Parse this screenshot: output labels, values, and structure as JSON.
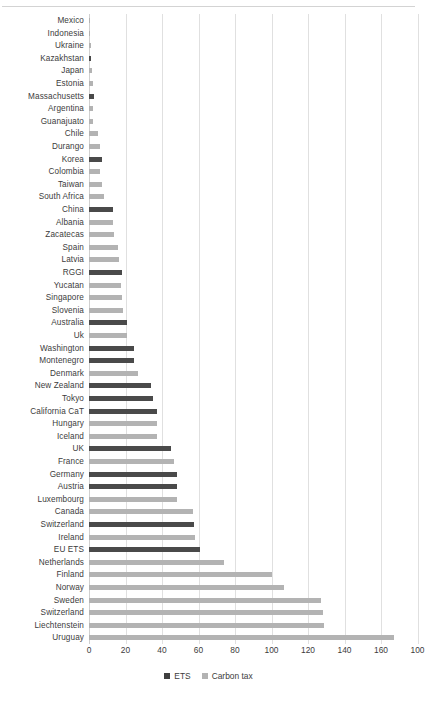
{
  "chart_data": {
    "type": "bar",
    "orientation": "horizontal",
    "title": "",
    "xlabel": "",
    "ylabel": "",
    "xlim": [
      0,
      180
    ],
    "grid": true,
    "xticks": [
      0,
      20,
      40,
      60,
      80,
      100,
      120,
      140,
      160,
      100
    ],
    "legend_position": "bottom",
    "legend": [
      {
        "name": "ETS",
        "color": "#4a4a4a"
      },
      {
        "name": "Carbon tax",
        "color": "#b3b3b3"
      }
    ],
    "categories": [
      "Mexico",
      "Indonesia",
      "Ukraine",
      "Kazakhstan",
      "Japan",
      "Estonia",
      "Massachusetts",
      "Argentina",
      "Guanajuato",
      "Chile",
      "Durango",
      "Korea",
      "Colombia",
      "Taiwan",
      "South Africa",
      "China",
      "Albania",
      "Zacatecas",
      "Spain",
      "Latvia",
      "RGGI",
      "Yucatan",
      "Singapore",
      "Slovenia",
      "Australia",
      "Uk",
      "Washington",
      "Montenegro",
      "Denmark",
      "New Zealand",
      "Tokyo",
      "California CaT",
      "Hungary",
      "Iceland",
      "UK",
      "France",
      "Germany",
      "Austria",
      "Luxembourg",
      "Canada",
      "Switzerland",
      "Ireland",
      "EU ETS",
      "Netherlands",
      "Finland",
      "Norway",
      "Sweden",
      "Switzerland",
      "Liechtenstein",
      "Uruguay"
    ],
    "bars": [
      {
        "category": "Mexico",
        "series": "Carbon tax",
        "value": 0.4
      },
      {
        "category": "Indonesia",
        "series": "Carbon tax",
        "value": 0.6
      },
      {
        "category": "Ukraine",
        "series": "Carbon tax",
        "value": 1.0
      },
      {
        "category": "Kazakhstan",
        "series": "ETS",
        "value": 1.2
      },
      {
        "category": "Japan",
        "series": "Carbon tax",
        "value": 1.6
      },
      {
        "category": "Estonia",
        "series": "Carbon tax",
        "value": 2.0
      },
      {
        "category": "Massachusetts",
        "series": "ETS",
        "value": 2.6
      },
      {
        "category": "Argentina",
        "series": "Carbon tax",
        "value": 2.0
      },
      {
        "category": "Guanajuato",
        "series": "Carbon tax",
        "value": 2.2
      },
      {
        "category": "Chile",
        "series": "Carbon tax",
        "value": 5.0
      },
      {
        "category": "Durango",
        "series": "Carbon tax",
        "value": 6.0
      },
      {
        "category": "Korea",
        "series": "ETS",
        "value": 7.0
      },
      {
        "category": "Colombia",
        "series": "Carbon tax",
        "value": 6.0
      },
      {
        "category": "Taiwan",
        "series": "Carbon tax",
        "value": 7.0
      },
      {
        "category": "South Africa",
        "series": "Carbon tax",
        "value": 8.0
      },
      {
        "category": "China",
        "series": "ETS",
        "value": 13.0
      },
      {
        "category": "Albania",
        "series": "Carbon tax",
        "value": 13.0
      },
      {
        "category": "Zacatecas",
        "series": "Carbon tax",
        "value": 13.5
      },
      {
        "category": "Spain",
        "series": "Carbon tax",
        "value": 16.0
      },
      {
        "category": "Latvia",
        "series": "Carbon tax",
        "value": 16.5
      },
      {
        "category": "RGGI",
        "series": "ETS",
        "value": 18.0
      },
      {
        "category": "Yucatan",
        "series": "Carbon tax",
        "value": 17.5
      },
      {
        "category": "Singapore",
        "series": "Carbon tax",
        "value": 18.0
      },
      {
        "category": "Slovenia",
        "series": "Carbon tax",
        "value": 18.5
      },
      {
        "category": "Australia",
        "series": "ETS",
        "value": 21.0
      },
      {
        "category": "Uk",
        "series": "Carbon tax",
        "value": 21.0
      },
      {
        "category": "Washington",
        "series": "ETS",
        "value": 24.5
      },
      {
        "category": "Montenegro",
        "series": "ETS",
        "value": 24.5
      },
      {
        "category": "Denmark",
        "series": "Carbon tax",
        "value": 27.0
      },
      {
        "category": "New Zealand",
        "series": "ETS",
        "value": 34.0
      },
      {
        "category": "Tokyo",
        "series": "ETS",
        "value": 35.0
      },
      {
        "category": "California CaT",
        "series": "ETS",
        "value": 37.0
      },
      {
        "category": "Hungary",
        "series": "Carbon tax",
        "value": 37.0
      },
      {
        "category": "Iceland",
        "series": "Carbon tax",
        "value": 37.5
      },
      {
        "category": "UK",
        "series": "ETS",
        "value": 45.0
      },
      {
        "category": "France",
        "series": "Carbon tax",
        "value": 46.5
      },
      {
        "category": "Germany",
        "series": "ETS",
        "value": 48.0
      },
      {
        "category": "Austria",
        "series": "ETS",
        "value": 48.0
      },
      {
        "category": "Luxembourg",
        "series": "Carbon tax",
        "value": 48.0
      },
      {
        "category": "Canada",
        "series": "Carbon tax",
        "value": 57.0
      },
      {
        "category": "Switzerland",
        "series": "ETS",
        "value": 57.5
      },
      {
        "category": "Ireland",
        "series": "Carbon tax",
        "value": 58.0
      },
      {
        "category": "EU ETS",
        "series": "ETS",
        "value": 61.0
      },
      {
        "category": "Netherlands",
        "series": "Carbon tax",
        "value": 74.0
      },
      {
        "category": "Finland",
        "series": "Carbon tax",
        "value": 100.0
      },
      {
        "category": "Norway",
        "series": "Carbon tax",
        "value": 107.0
      },
      {
        "category": "Sweden",
        "series": "Carbon tax",
        "value": 127.0
      },
      {
        "category": "Switzerland",
        "series": "Carbon tax",
        "value": 128.0
      },
      {
        "category": "Liechtenstein",
        "series": "Carbon tax",
        "value": 129.0
      },
      {
        "category": "Uruguay",
        "series": "Carbon tax",
        "value": 167.0
      }
    ]
  },
  "colors": {
    "ets": "#4a4a4a",
    "carbon_tax": "#b3b3b3",
    "gridline": "#e0e0e0",
    "text": "#3c3c3c"
  }
}
